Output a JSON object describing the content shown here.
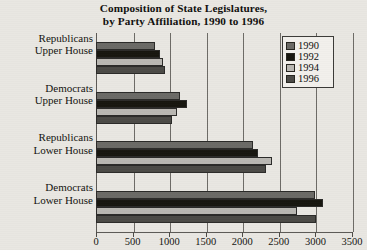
{
  "chart_data": {
    "type": "bar",
    "orientation": "horizontal",
    "title": "Composition of State Legislatures, by Party Affiliation, 1990 to 1996",
    "title_lines": [
      "Composition of State Legislatures,",
      "by Party Affiliation, 1990 to 1996"
    ],
    "xlabel": "",
    "ylabel": "",
    "xlim": [
      0,
      3500
    ],
    "grid": "vertical",
    "legend_position": "top-right-inside",
    "categories": [
      "Republicans Upper House",
      "Democrats Upper House",
      "Republicans Lower House",
      "Democrats Lower House"
    ],
    "category_lines": [
      [
        "Republicans",
        "Upper House"
      ],
      [
        "Democrats",
        "Upper House"
      ],
      [
        "Republicans",
        "Lower House"
      ],
      [
        "Democrats",
        "Lower House"
      ]
    ],
    "xticks": [
      0,
      500,
      1000,
      1500,
      2000,
      2500,
      3000,
      3500
    ],
    "xtick_labels": [
      "0",
      "500",
      "1000",
      "1500",
      "2000",
      "2500",
      "3000",
      "3500"
    ],
    "series": [
      {
        "name": "1990",
        "color": "#6b6a66",
        "values": [
          800,
          1150,
          2150,
          3000
        ]
      },
      {
        "name": "1992",
        "color": "#17160f",
        "values": [
          870,
          1250,
          2220,
          3100
        ]
      },
      {
        "name": "1994",
        "color": "#b9b7b2",
        "values": [
          910,
          1110,
          2400,
          2750
        ]
      },
      {
        "name": "1996",
        "color": "#4b4a46",
        "values": [
          950,
          1040,
          2330,
          3010
        ]
      }
    ]
  },
  "legend": {
    "items": [
      {
        "label": "1990",
        "color": "#6b6a66"
      },
      {
        "label": "1992",
        "color": "#17160f"
      },
      {
        "label": "1994",
        "color": "#b9b7b2"
      },
      {
        "label": "1996",
        "color": "#4b4a46"
      }
    ]
  },
  "colors": {
    "background": "#e9e7e2",
    "axis": "#5b5955",
    "grid": "#6d6b66",
    "text": "#14130f"
  }
}
